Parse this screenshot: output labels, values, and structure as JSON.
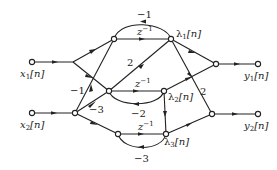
{
  "diagram": {
    "type": "signal-flow-graph",
    "inputs": [
      {
        "id": "x1",
        "label": "x",
        "sub": "1",
        "suffix": "[n]"
      },
      {
        "id": "x2",
        "label": "x",
        "sub": "2",
        "suffix": "[n]"
      }
    ],
    "outputs": [
      {
        "id": "y1",
        "label": "y",
        "sub": "1",
        "suffix": "[n]"
      },
      {
        "id": "y2",
        "label": "y",
        "sub": "2",
        "suffix": "[n]"
      }
    ],
    "states": [
      {
        "id": "lambda1",
        "label": "λ",
        "sub": "1",
        "suffix": "[n]",
        "delay": "z",
        "delay_exp": "−1",
        "feedback": "−1"
      },
      {
        "id": "lambda2",
        "label": "λ",
        "sub": "2",
        "suffix": "[n]",
        "delay": "z",
        "delay_exp": "−1",
        "feedback": "−2"
      },
      {
        "id": "lambda3",
        "label": "λ",
        "sub": "3",
        "suffix": "[n]",
        "delay": "z",
        "delay_exp": "−1",
        "feedback": "−3"
      }
    ],
    "gains": {
      "x2_to_lambda1_branch": "−1",
      "x2_to_lambda2_branch": "−3",
      "lambda2_branch_to_lambda1": "2",
      "lambda1_to_y2": "2"
    }
  }
}
